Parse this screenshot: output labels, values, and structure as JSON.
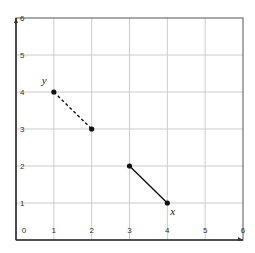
{
  "chart_data": {
    "type": "line",
    "title": "",
    "xlabel": "",
    "ylabel": "",
    "xlim": [
      0,
      6
    ],
    "ylim": [
      0,
      6
    ],
    "grid": true,
    "x_ticks": [
      "0",
      "1",
      "2",
      "3",
      "4",
      "5",
      "6"
    ],
    "y_ticks": [
      "1",
      "2",
      "3",
      "4",
      "5",
      "6"
    ],
    "series": [
      {
        "name": "y",
        "style": "dashed",
        "points": [
          [
            1,
            4
          ],
          [
            2,
            3
          ]
        ],
        "label_at": [
          1,
          4
        ]
      },
      {
        "name": "x",
        "style": "solid",
        "points": [
          [
            3,
            2
          ],
          [
            4,
            1
          ]
        ],
        "label_at": [
          4,
          1
        ]
      }
    ],
    "annotations": [
      {
        "text": "y",
        "near": [
          1,
          4
        ],
        "position": "upper-left"
      },
      {
        "text": "x",
        "near": [
          4,
          1
        ],
        "position": "lower-right"
      }
    ]
  },
  "labels": {
    "y_label": "y",
    "x_label": "x",
    "origin": "0"
  },
  "colors": {
    "grid": "#cccccc",
    "axis": "#555555",
    "line": "#111111"
  }
}
